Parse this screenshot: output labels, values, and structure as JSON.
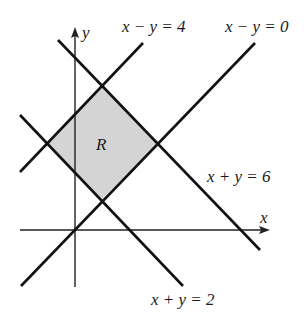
{
  "diagram": {
    "region_label": "R",
    "axes": {
      "x_label": "x",
      "y_label": "y"
    },
    "lines": [
      {
        "id": "x-minus-y-4",
        "label": "x − y = 4"
      },
      {
        "id": "x-minus-y-0",
        "label": "x − y = 0"
      },
      {
        "id": "x-plus-y-6",
        "label": "x + y = 6"
      },
      {
        "id": "x-plus-y-2",
        "label": "x + y = 2"
      }
    ],
    "colors": {
      "region_fill": "#d4d4d4",
      "line": "#111111"
    }
  }
}
